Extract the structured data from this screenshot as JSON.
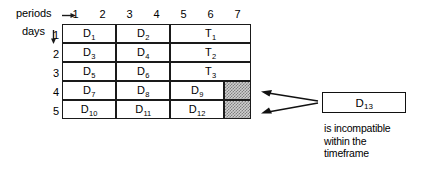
{
  "axes": {
    "periods_label": "periods",
    "periods_arrow_icon": "arrow-right-icon",
    "days_label": "days",
    "days_arrow_icon": "arrow-down-icon",
    "column_headers": [
      "1",
      "2",
      "3",
      "4",
      "5",
      "6",
      "7"
    ],
    "row_headers": [
      "1",
      "2",
      "3",
      "4",
      "5"
    ]
  },
  "grid": {
    "rows": [
      {
        "row_header": "1",
        "cells": [
          {
            "base": "D",
            "sub": "1",
            "span": 2,
            "hatched": false
          },
          {
            "base": "D",
            "sub": "2",
            "span": 2,
            "hatched": false
          },
          {
            "base": "T",
            "sub": "1",
            "span": 3,
            "hatched": false
          }
        ]
      },
      {
        "row_header": "2",
        "cells": [
          {
            "base": "D",
            "sub": "3",
            "span": 2,
            "hatched": false
          },
          {
            "base": "D",
            "sub": "4",
            "span": 2,
            "hatched": false
          },
          {
            "base": "T",
            "sub": "2",
            "span": 3,
            "hatched": false
          }
        ]
      },
      {
        "row_header": "3",
        "cells": [
          {
            "base": "D",
            "sub": "5",
            "span": 2,
            "hatched": false
          },
          {
            "base": "D",
            "sub": "6",
            "span": 2,
            "hatched": false
          },
          {
            "base": "T",
            "sub": "3",
            "span": 3,
            "hatched": false
          }
        ]
      },
      {
        "row_header": "4",
        "cells": [
          {
            "base": "D",
            "sub": "7",
            "span": 2,
            "hatched": false
          },
          {
            "base": "D",
            "sub": "8",
            "span": 2,
            "hatched": false
          },
          {
            "base": "D",
            "sub": "9",
            "span": 2,
            "hatched": false
          },
          {
            "base": "",
            "sub": "",
            "span": 1,
            "hatched": true
          }
        ]
      },
      {
        "row_header": "5",
        "cells": [
          {
            "base": "D",
            "sub": "10",
            "span": 2,
            "hatched": false
          },
          {
            "base": "D",
            "sub": "11",
            "span": 2,
            "hatched": false
          },
          {
            "base": "D",
            "sub": "12",
            "span": 2,
            "hatched": false
          },
          {
            "base": "",
            "sub": "",
            "span": 1,
            "hatched": true
          }
        ]
      }
    ]
  },
  "callout": {
    "box_base": "D",
    "box_sub": "13",
    "caption_line_1": "is incompatible",
    "caption_line_2": "within the",
    "caption_line_3": "timeframe",
    "arrow_icon": "arrow-left-icon",
    "arrow_count": 2
  },
  "colors": {
    "ink": "#1a1a1a",
    "paper": "#ffffff",
    "hatch_light": "#cfcfcf",
    "hatch_dark": "#808080"
  }
}
